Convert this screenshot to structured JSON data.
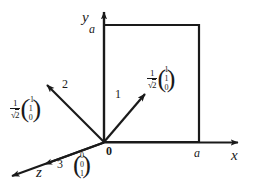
{
  "figure": {
    "type": "vector-diagram",
    "background": "#ffffff",
    "stroke": "#1a1a1a",
    "axes": {
      "x": {
        "label": "x",
        "tick_label": "a"
      },
      "y": {
        "label": "y",
        "tick_label": "a"
      },
      "z": {
        "label": "z"
      }
    },
    "square": {
      "side_label": "a"
    },
    "origin_label": "0",
    "vectors": [
      {
        "id": "1",
        "number_label": "1",
        "scalar_numerator": "1",
        "scalar_denominator_radicand": "2",
        "components": [
          "1",
          "1",
          "0"
        ]
      },
      {
        "id": "2",
        "number_label": "2",
        "scalar_numerator": "1",
        "scalar_denominator_radicand": "2",
        "components": [
          "-1",
          "1",
          "0"
        ]
      },
      {
        "id": "3",
        "number_label": "3",
        "components": [
          "0",
          "0",
          "1"
        ]
      }
    ],
    "radical_symbol": "√"
  }
}
